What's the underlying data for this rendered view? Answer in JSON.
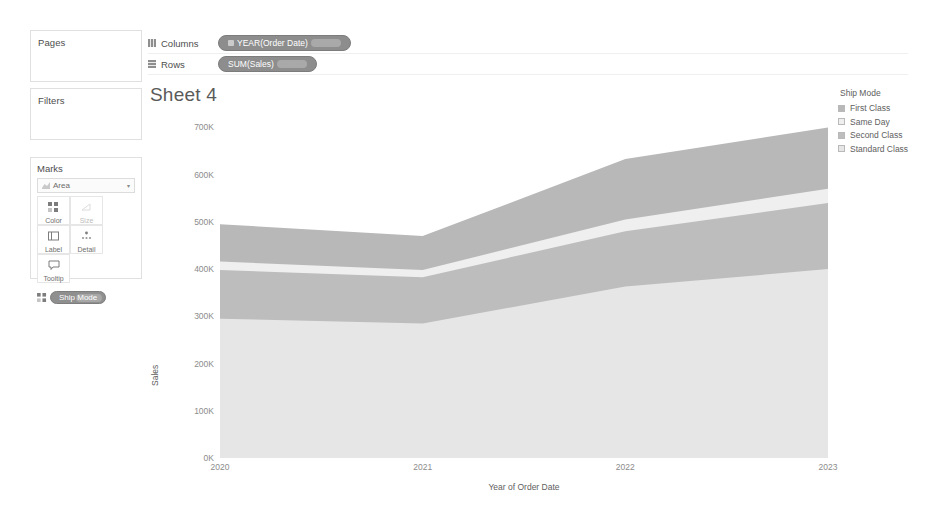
{
  "panels": {
    "pages_label": "Pages",
    "filters_label": "Filters",
    "marks_label": "Marks",
    "mark_type": "Area",
    "mark_type_icon": "area-chart-icon",
    "caret": "▾",
    "buttons": [
      {
        "label": "Color",
        "icon": "color-icon",
        "dim": false
      },
      {
        "label": "Size",
        "icon": "size-icon",
        "dim": true
      },
      {
        "label": "Label",
        "icon": "label-icon",
        "dim": false
      },
      {
        "label": "Detail",
        "icon": "detail-icon",
        "dim": false
      },
      {
        "label": "Tooltip",
        "icon": "tooltip-icon",
        "dim": false
      }
    ],
    "color_pill": "Ship Mode"
  },
  "shelves": {
    "columns_label": "Columns",
    "columns_icon": "columns-grid-icon",
    "columns_pill": "YEAR(Order Date)",
    "rows_label": "Rows",
    "rows_icon": "rows-grid-icon",
    "rows_pill": "SUM(Sales)"
  },
  "sheet": {
    "title": "Sheet 4"
  },
  "legend": {
    "title": "Ship Mode",
    "items": [
      {
        "label": "First Class",
        "color": "#b8b8b8"
      },
      {
        "label": "Same Day",
        "color": "#efefef"
      },
      {
        "label": "Second Class",
        "color": "#bdbdbd"
      },
      {
        "label": "Standard Class",
        "color": "#e6e6e6"
      }
    ]
  },
  "chart_data": {
    "type": "area",
    "title": "Sheet 4",
    "xlabel": "Year of Order Date",
    "ylabel": "Sales",
    "x": [
      "2020",
      "2021",
      "2022",
      "2023"
    ],
    "categories": [
      "2020",
      "2021",
      "2022",
      "2023"
    ],
    "xticklabels": [
      "2020",
      "2021",
      "2022",
      "2023"
    ],
    "yticklabels": [
      "0K",
      "100K",
      "200K",
      "300K",
      "400K",
      "500K",
      "600K",
      "700K"
    ],
    "ytickvalues": [
      0,
      100000,
      200000,
      300000,
      400000,
      500000,
      600000,
      700000
    ],
    "ylim": [
      0,
      720000
    ],
    "grid": false,
    "stacked": true,
    "legend_position": "right",
    "legend_title": "Ship Mode",
    "series": [
      {
        "name": "Standard Class",
        "color": "#e6e6e6",
        "values": [
          295000,
          285000,
          363000,
          400000
        ]
      },
      {
        "name": "Second Class",
        "color": "#bdbdbd",
        "values": [
          103000,
          98000,
          117000,
          140000
        ]
      },
      {
        "name": "Same Day",
        "color": "#efefef",
        "values": [
          18000,
          15000,
          25000,
          30000
        ]
      },
      {
        "name": "First Class",
        "color": "#b8b8b8",
        "values": [
          79000,
          72000,
          128000,
          130000
        ]
      }
    ],
    "cumulative_tops": {
      "Standard Class": [
        295000,
        285000,
        363000,
        400000
      ],
      "Second Class": [
        398000,
        383000,
        480000,
        540000
      ],
      "Same Day": [
        416000,
        398000,
        505000,
        570000
      ],
      "First Class": [
        495000,
        470000,
        633000,
        700000
      ]
    }
  }
}
